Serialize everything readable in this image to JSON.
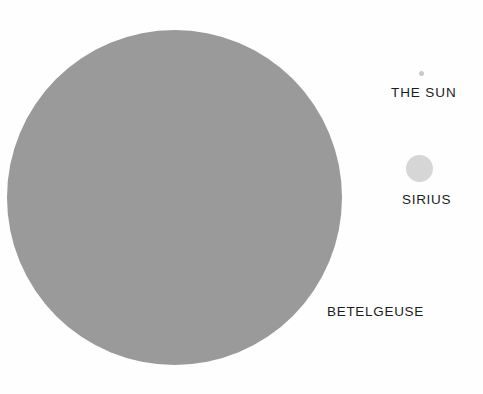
{
  "figure": {
    "kind": "star-size-comparison",
    "background_color": "#fefefe"
  },
  "stars": [
    {
      "key": "betelgeuse",
      "label": "BETELGEUSE",
      "color": "#9a9a9a",
      "label_color": "#1c1c1c",
      "relative_diameter_px": 335
    },
    {
      "key": "sirius",
      "label": "SIRIUS",
      "color": "#d6d6d6",
      "label_color": "#1c1c1c",
      "relative_diameter_px": 27
    },
    {
      "key": "the_sun",
      "label": "THE  SUN",
      "color": "#c9c9c9",
      "label_color": "#1c1c1c",
      "relative_diameter_px": 5
    }
  ],
  "chart_data": {
    "type": "bubble",
    "title": "",
    "xlabel": "",
    "ylabel": "",
    "categories": [
      "BETELGEUSE",
      "SIRIUS",
      "THE  SUN"
    ],
    "values": [
      335,
      27,
      5
    ],
    "value_unit": "rendered diameter in px (area-proportional star size comparison)",
    "series": [
      {
        "name": "Relative star diameter",
        "values": [
          335,
          27,
          5
        ]
      }
    ],
    "points": [
      {
        "label": "BETELGEUSE",
        "cx": 174,
        "cy": 197,
        "diameter": 335,
        "color": "#9a9a9a"
      },
      {
        "label": "SIRIUS",
        "cx": 419,
        "cy": 168,
        "diameter": 27,
        "color": "#d6d6d6"
      },
      {
        "label": "THE  SUN",
        "cx": 421,
        "cy": 73,
        "diameter": 5,
        "color": "#c9c9c9"
      }
    ],
    "grid": false,
    "legend": "none",
    "annotations": [
      "BETELGEUSE",
      "SIRIUS",
      "THE  SUN"
    ]
  }
}
